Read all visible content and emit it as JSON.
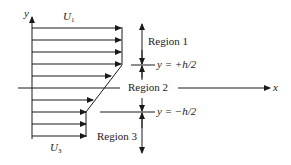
{
  "diagram": {
    "axes": {
      "y_label": "y",
      "x_label": "x"
    },
    "velocity_labels": {
      "top": "U",
      "top_sub": "1",
      "bottom": "U",
      "bottom_sub": "3"
    },
    "regions": [
      {
        "label": "Region 1"
      },
      {
        "label": "Region 2"
      },
      {
        "label": "Region 3"
      }
    ],
    "boundaries": {
      "upper": "y = +h/2",
      "lower": "y = −h/2"
    },
    "colors": {
      "line": "#1a1a1a",
      "background": "#ffffff"
    }
  }
}
